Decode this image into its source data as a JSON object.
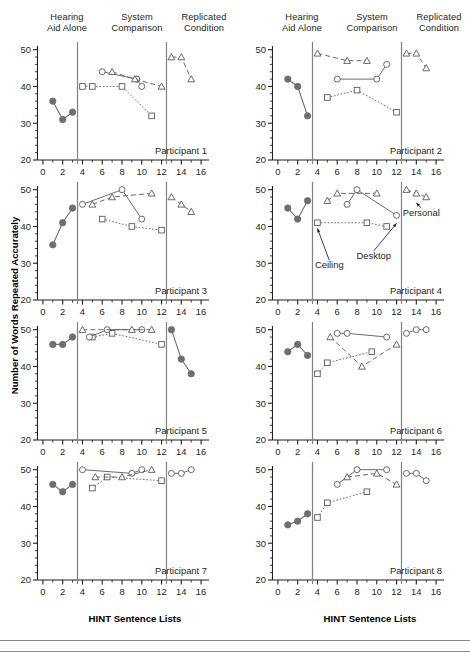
{
  "figure": {
    "y_axis_title": "Number of Words Repeated Accurately",
    "x_axis_title": "HINT Sentence Lists",
    "column_headers": [
      {
        "line1": "Hearing",
        "line2": "Aid Alone"
      },
      {
        "line1": "System",
        "line2": "Comparison"
      },
      {
        "line1": "Replicated",
        "line2": "Condition"
      }
    ],
    "x_ticks": [
      "0",
      "2",
      "4",
      "6",
      "8",
      "10",
      "12",
      "14",
      "16"
    ],
    "y_ticks": [
      "20",
      "30",
      "40",
      "50"
    ],
    "xlim": [
      -0.8,
      16.8
    ],
    "ylim": [
      20,
      51
    ],
    "dividers": [
      3.5,
      12.5
    ],
    "colors": {
      "filled_marker": "#6d6e71",
      "open_marker_stroke": "#58595b",
      "axis": "#231f20",
      "divider": "#808285",
      "text": "#231f20"
    }
  },
  "chart_data": {
    "type": "scatter",
    "title": "",
    "xlabel": "HINT Sentence Lists",
    "ylabel": "Number of Words Repeated Accurately",
    "xlim": [
      -0.8,
      16.8
    ],
    "ylim": [
      20,
      51
    ],
    "grid": false,
    "legend_position": "none",
    "series_styles": {
      "hearing_aid_alone": {
        "marker": "filled-circle",
        "line": "solid"
      },
      "ceiling": {
        "marker": "open-square",
        "line": "dotted"
      },
      "desktop": {
        "marker": "open-circle",
        "line": "solid"
      },
      "personal": {
        "marker": "open-triangle",
        "line": "dashed"
      },
      "replicated_circle": {
        "marker": "open-circle",
        "line": "solid"
      },
      "replicated_triangle": {
        "marker": "open-triangle",
        "line": "dashed"
      },
      "replicated_filled": {
        "marker": "filled-circle",
        "line": "solid"
      }
    },
    "panels": [
      {
        "label": "Participant 1",
        "annotations": [],
        "series": [
          {
            "name": "hearing_aid_alone",
            "marker": "filled-circle",
            "line": "solid",
            "x": [
              1,
              2,
              3
            ],
            "y": [
              36,
              31,
              33
            ]
          },
          {
            "name": "ceiling",
            "marker": "open-square",
            "line": "dotted",
            "x": [
              4,
              5,
              8,
              11
            ],
            "y": [
              40,
              40,
              40,
              32
            ]
          },
          {
            "name": "desktop",
            "marker": "open-circle",
            "line": "solid",
            "x": [
              6,
              9.5
            ],
            "y": [
              44,
              42
            ]
          },
          {
            "name": "desktop_b",
            "marker": "open-circle",
            "line": "solid",
            "x": [
              9.5,
              10
            ],
            "y": [
              42,
              40
            ]
          },
          {
            "name": "personal",
            "marker": "open-triangle",
            "line": "dashed",
            "x": [
              7,
              9.3,
              12
            ],
            "y": [
              44,
              42,
              40
            ]
          },
          {
            "name": "replicated_triangle",
            "marker": "open-triangle",
            "line": "dashed",
            "x": [
              13,
              14,
              15
            ],
            "y": [
              48,
              48,
              42
            ]
          }
        ]
      },
      {
        "label": "Participant 2",
        "annotations": [],
        "series": [
          {
            "name": "hearing_aid_alone",
            "marker": "filled-circle",
            "line": "solid",
            "x": [
              1,
              2,
              3
            ],
            "y": [
              42,
              40,
              32
            ]
          },
          {
            "name": "ceiling",
            "marker": "open-square",
            "line": "dotted",
            "x": [
              5,
              8,
              12
            ],
            "y": [
              37,
              39,
              33
            ]
          },
          {
            "name": "desktop",
            "marker": "open-circle",
            "line": "solid",
            "x": [
              6,
              10,
              11
            ],
            "y": [
              42,
              42,
              46
            ]
          },
          {
            "name": "personal",
            "marker": "open-triangle",
            "line": "dashed",
            "x": [
              4,
              7,
              9
            ],
            "y": [
              49,
              47,
              47
            ]
          },
          {
            "name": "replicated_triangle",
            "marker": "open-triangle",
            "line": "dashed",
            "x": [
              13,
              14,
              15
            ],
            "y": [
              49,
              49,
              45
            ]
          }
        ]
      },
      {
        "label": "Participant 3",
        "annotations": [],
        "series": [
          {
            "name": "hearing_aid_alone",
            "marker": "filled-circle",
            "line": "solid",
            "x": [
              1,
              2,
              3
            ],
            "y": [
              35,
              41,
              45
            ]
          },
          {
            "name": "ceiling",
            "marker": "open-square",
            "line": "dotted",
            "x": [
              6,
              9,
              12
            ],
            "y": [
              42,
              40,
              39
            ]
          },
          {
            "name": "desktop",
            "marker": "open-circle",
            "line": "solid",
            "x": [
              4,
              8,
              10
            ],
            "y": [
              46,
              50,
              42
            ]
          },
          {
            "name": "personal",
            "marker": "open-triangle",
            "line": "dashed",
            "x": [
              5,
              7,
              11
            ],
            "y": [
              46,
              48,
              49
            ]
          },
          {
            "name": "replicated_triangle",
            "marker": "open-triangle",
            "line": "dashed",
            "x": [
              13,
              14,
              15
            ],
            "y": [
              48,
              46,
              44
            ]
          }
        ]
      },
      {
        "label": "Participant 4",
        "annotations": [
          {
            "text": "Ceiling",
            "tx": 5.2,
            "ty": 28.6,
            "px": 4,
            "py": 40.4
          },
          {
            "text": "Desktop",
            "tx": 9.7,
            "ty": 31.2,
            "px": 12,
            "py": 41.8
          },
          {
            "text": "Personal",
            "tx": 14.5,
            "ty": 42.8,
            "px": 14,
            "py": 47.4
          }
        ],
        "series": [
          {
            "name": "hearing_aid_alone",
            "marker": "filled-circle",
            "line": "solid",
            "x": [
              1,
              2,
              3
            ],
            "y": [
              45,
              42,
              47
            ]
          },
          {
            "name": "ceiling",
            "marker": "open-square",
            "line": "dotted",
            "x": [
              4,
              9,
              11
            ],
            "y": [
              41,
              41,
              40
            ]
          },
          {
            "name": "desktop",
            "marker": "open-circle",
            "line": "solid",
            "x": [
              7,
              8,
              12
            ],
            "y": [
              46,
              50,
              43
            ]
          },
          {
            "name": "personal",
            "marker": "open-triangle",
            "line": "dashed",
            "x": [
              5,
              6,
              10
            ],
            "y": [
              47,
              49,
              49
            ]
          },
          {
            "name": "replicated_triangle",
            "marker": "open-triangle",
            "line": "dashed",
            "x": [
              13,
              14,
              15
            ],
            "y": [
              50,
              49,
              48
            ]
          }
        ]
      },
      {
        "label": "Participant 5",
        "annotations": [],
        "series": [
          {
            "name": "hearing_aid_alone",
            "marker": "filled-circle",
            "line": "solid",
            "x": [
              1,
              2,
              3
            ],
            "y": [
              46,
              46,
              48
            ]
          },
          {
            "name": "ceiling",
            "marker": "open-square",
            "line": "dotted",
            "x": [
              5,
              7,
              12
            ],
            "y": [
              48,
              49,
              46
            ]
          },
          {
            "name": "desktop",
            "marker": "open-circle",
            "line": "solid",
            "x": [
              4.7,
              6.5,
              10
            ],
            "y": [
              48,
              50,
              50
            ]
          },
          {
            "name": "personal",
            "marker": "open-triangle",
            "line": "dashed",
            "x": [
              4,
              9,
              11
            ],
            "y": [
              50,
              50,
              50
            ]
          },
          {
            "name": "replicated_filled",
            "marker": "filled-circle",
            "line": "solid",
            "x": [
              13,
              14,
              15
            ],
            "y": [
              50,
              42,
              38
            ]
          }
        ]
      },
      {
        "label": "Participant 6",
        "annotations": [],
        "series": [
          {
            "name": "hearing_aid_alone",
            "marker": "filled-circle",
            "line": "solid",
            "x": [
              1,
              2,
              3
            ],
            "y": [
              44,
              46,
              43
            ]
          },
          {
            "name": "ceiling",
            "marker": "open-square",
            "line": "dotted",
            "x": [
              4,
              5,
              9.5
            ],
            "y": [
              38,
              41,
              44
            ]
          },
          {
            "name": "desktop",
            "marker": "open-circle",
            "line": "solid",
            "x": [
              6,
              7,
              11
            ],
            "y": [
              49,
              49,
              48
            ]
          },
          {
            "name": "personal",
            "marker": "open-triangle",
            "line": "dashed",
            "x": [
              5.3,
              8.5,
              12
            ],
            "y": [
              48,
              40,
              46
            ]
          },
          {
            "name": "replicated_circle",
            "marker": "open-circle",
            "line": "solid",
            "x": [
              13,
              14,
              15
            ],
            "y": [
              49,
              50,
              50
            ]
          }
        ]
      },
      {
        "label": "Participant 7",
        "annotations": [],
        "series": [
          {
            "name": "hearing_aid_alone",
            "marker": "filled-circle",
            "line": "solid",
            "x": [
              1,
              2,
              3
            ],
            "y": [
              46,
              44,
              46
            ]
          },
          {
            "name": "ceiling",
            "marker": "open-square",
            "line": "dotted",
            "x": [
              5,
              6.5,
              12
            ],
            "y": [
              45,
              48,
              47
            ]
          },
          {
            "name": "desktop",
            "marker": "open-circle",
            "line": "solid",
            "x": [
              4,
              9,
              10
            ],
            "y": [
              50,
              49,
              50
            ]
          },
          {
            "name": "personal",
            "marker": "open-triangle",
            "line": "dashed",
            "x": [
              5.3,
              8,
              11
            ],
            "y": [
              48,
              48,
              50
            ]
          },
          {
            "name": "replicated_circle",
            "marker": "open-circle",
            "line": "solid",
            "x": [
              13,
              14,
              15
            ],
            "y": [
              49,
              49,
              50
            ]
          }
        ]
      },
      {
        "label": "Participant 8",
        "annotations": [],
        "series": [
          {
            "name": "hearing_aid_alone",
            "marker": "filled-circle",
            "line": "solid",
            "x": [
              1,
              2,
              3
            ],
            "y": [
              35,
              36,
              38
            ]
          },
          {
            "name": "ceiling",
            "marker": "open-square",
            "line": "dotted",
            "x": [
              4,
              5,
              9
            ],
            "y": [
              37,
              41,
              44
            ]
          },
          {
            "name": "desktop",
            "marker": "open-circle",
            "line": "solid",
            "x": [
              6,
              8,
              11
            ],
            "y": [
              46,
              50,
              50
            ]
          },
          {
            "name": "personal",
            "marker": "open-triangle",
            "line": "dashed",
            "x": [
              7,
              10,
              12
            ],
            "y": [
              48,
              49,
              46
            ]
          },
          {
            "name": "replicated_circle",
            "marker": "open-circle",
            "line": "solid",
            "x": [
              13,
              14,
              15
            ],
            "y": [
              49,
              49,
              47
            ]
          }
        ]
      }
    ]
  }
}
